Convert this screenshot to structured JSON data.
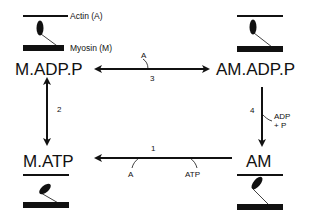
{
  "diagram": {
    "type": "actomyosin cross-bridge cycle",
    "legend": {
      "actin_label": "Actin (A)",
      "myosin_label": "Myosin (M)"
    },
    "states": {
      "top_left": "M.ADP.P",
      "top_right": "AM.ADP.P",
      "bottom_right": "AM",
      "bottom_left": "M.ATP"
    },
    "transitions": [
      {
        "id": "1",
        "label": "1",
        "from": "AM",
        "to": "M.ATP",
        "inputs": [
          "ATP"
        ],
        "outputs": [
          "A"
        ],
        "bidirectional": false
      },
      {
        "id": "2",
        "label": "2",
        "from": "M.ATP",
        "to": "M.ADP.P",
        "bidirectional": true
      },
      {
        "id": "3",
        "label": "3",
        "from": "M.ADP.P",
        "to": "AM.ADP.P",
        "inputs": [
          "A"
        ],
        "bidirectional": true
      },
      {
        "id": "4",
        "label": "4",
        "from": "AM.ADP.P",
        "to": "AM",
        "outputs": [
          "ADP",
          "+ P"
        ],
        "bidirectional": false
      }
    ],
    "annotations": {
      "t3_input": "A",
      "t4_out_1": "ADP",
      "t4_out_2": "+ P",
      "t1_out": "A",
      "t1_in": "ATP"
    },
    "colors": {
      "ink": "#111111",
      "background": "#ffffff"
    }
  }
}
